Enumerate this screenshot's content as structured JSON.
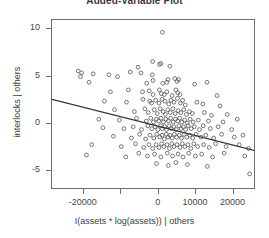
{
  "chart_data": {
    "type": "scatter",
    "title": "Added-Variable Plot",
    "xlabel": "I(assets * log(assets)) | others",
    "ylabel": "interlocks | others",
    "xlim": [
      -28500,
      26000
    ],
    "ylim": [
      -7.0,
      11.0
    ],
    "xticks": [
      -20000,
      -10000,
      0,
      10000,
      20000
    ],
    "xtick_labels": [
      "-20000",
      "",
      "0",
      "10000",
      "20000"
    ],
    "yticks": [
      10,
      5,
      0,
      -5
    ],
    "ytick_labels": [
      "10",
      "5",
      "0",
      "-5"
    ],
    "grid": false,
    "legend": null,
    "marker": "open-circle",
    "marker_color": "#555555",
    "regression_line": {
      "color": "#333333",
      "x_start": -28500,
      "y_start": 2.6,
      "x_end": 26000,
      "y_end": -2.85,
      "slope": -0.0001,
      "intercept": -0.25
    },
    "points": [
      [
        1000,
        9.7
      ],
      [
        -1600,
        6.6
      ],
      [
        -5500,
        6.0
      ],
      [
        200,
        6.3
      ],
      [
        600,
        6.4
      ],
      [
        3000,
        6.1
      ],
      [
        -21500,
        5.6
      ],
      [
        -20600,
        5.4
      ],
      [
        -20900,
        5.0
      ],
      [
        -17500,
        5.3
      ],
      [
        -13300,
        5.2
      ],
      [
        -11000,
        5.0
      ],
      [
        -7600,
        5.5
      ],
      [
        -4700,
        5.4
      ],
      [
        -1700,
        5.2
      ],
      [
        -1500,
        4.6
      ],
      [
        2500,
        4.7
      ],
      [
        -18600,
        4.4
      ],
      [
        -3200,
        4.3
      ],
      [
        1100,
        4.3
      ],
      [
        2200,
        4.4
      ],
      [
        4300,
        4.8
      ],
      [
        4900,
        4.5
      ],
      [
        5300,
        4.7
      ],
      [
        9600,
        4.2
      ],
      [
        12900,
        4.4
      ],
      [
        -12900,
        3.4
      ],
      [
        -8100,
        3.6
      ],
      [
        -4300,
        3.4
      ],
      [
        -2500,
        3.5
      ],
      [
        -1500,
        3.1
      ],
      [
        200,
        3.6
      ],
      [
        700,
        3.2
      ],
      [
        1500,
        3.1
      ],
      [
        2200,
        3.4
      ],
      [
        3600,
        3.0
      ],
      [
        4600,
        3.6
      ],
      [
        5100,
        3.3
      ],
      [
        5700,
        3.1
      ],
      [
        15600,
        3.0
      ],
      [
        -14500,
        2.4
      ],
      [
        -8600,
        2.3
      ],
      [
        -4200,
        2.6
      ],
      [
        -2400,
        2.4
      ],
      [
        -1900,
        2.2
      ],
      [
        -800,
        2.5
      ],
      [
        100,
        2.2
      ],
      [
        900,
        2.6
      ],
      [
        1700,
        2.4
      ],
      [
        2700,
        2.1
      ],
      [
        3300,
        2.5
      ],
      [
        4100,
        2.3
      ],
      [
        5000,
        2.7
      ],
      [
        5800,
        2.2
      ],
      [
        6400,
        2.5
      ],
      [
        7100,
        2.0
      ],
      [
        10200,
        2.3
      ],
      [
        11800,
        2.1
      ],
      [
        16400,
        1.9
      ],
      [
        -11800,
        1.5
      ],
      [
        -6500,
        1.3
      ],
      [
        -3700,
        1.6
      ],
      [
        -2800,
        1.2
      ],
      [
        -1200,
        1.5
      ],
      [
        -400,
        1.1
      ],
      [
        400,
        1.6
      ],
      [
        1200,
        1.3
      ],
      [
        1800,
        1.0
      ],
      [
        2400,
        1.5
      ],
      [
        3100,
        1.2
      ],
      [
        3800,
        1.6
      ],
      [
        4400,
        1.1
      ],
      [
        5200,
        1.4
      ],
      [
        5900,
        1.2
      ],
      [
        6700,
        1.5
      ],
      [
        7400,
        1.0
      ],
      [
        8200,
        1.3
      ],
      [
        9000,
        1.1
      ],
      [
        12200,
        1.2
      ],
      [
        14100,
        0.9
      ],
      [
        18300,
        1.0
      ],
      [
        -16000,
        0.5
      ],
      [
        -10500,
        0.4
      ],
      [
        -5900,
        0.6
      ],
      [
        -3300,
        0.3
      ],
      [
        -2100,
        0.6
      ],
      [
        -1400,
        0.2
      ],
      [
        -600,
        0.5
      ],
      [
        0,
        0.3
      ],
      [
        600,
        0.6
      ],
      [
        1300,
        0.2
      ],
      [
        1900,
        0.5
      ],
      [
        2600,
        0.3
      ],
      [
        3200,
        0.6
      ],
      [
        3900,
        0.2
      ],
      [
        4500,
        0.5
      ],
      [
        5100,
        0.3
      ],
      [
        5600,
        0.6
      ],
      [
        6200,
        0.2
      ],
      [
        6900,
        0.4
      ],
      [
        7600,
        0.1
      ],
      [
        8400,
        0.5
      ],
      [
        9200,
        0.2
      ],
      [
        10600,
        0.4
      ],
      [
        13300,
        0.3
      ],
      [
        17200,
        0.2
      ],
      [
        21000,
        0.5
      ],
      [
        -14900,
        -0.4
      ],
      [
        -9300,
        -0.5
      ],
      [
        -6800,
        -0.3
      ],
      [
        -4600,
        -0.6
      ],
      [
        -2900,
        -0.2
      ],
      [
        -1800,
        -0.5
      ],
      [
        -1000,
        -0.3
      ],
      [
        -200,
        -0.6
      ],
      [
        500,
        -0.2
      ],
      [
        1000,
        -0.5
      ],
      [
        1600,
        -0.3
      ],
      [
        2100,
        -0.6
      ],
      [
        2800,
        -0.2
      ],
      [
        3400,
        -0.5
      ],
      [
        4000,
        -0.3
      ],
      [
        4700,
        -0.6
      ],
      [
        5400,
        -0.2
      ],
      [
        6000,
        -0.5
      ],
      [
        6600,
        -0.3
      ],
      [
        7200,
        -0.6
      ],
      [
        7900,
        -0.2
      ],
      [
        8700,
        -0.5
      ],
      [
        9500,
        -0.3
      ],
      [
        10900,
        -0.6
      ],
      [
        11900,
        -0.2
      ],
      [
        13800,
        -0.5
      ],
      [
        15900,
        -0.3
      ],
      [
        19500,
        -0.6
      ],
      [
        -12100,
        -1.3
      ],
      [
        -7300,
        -1.5
      ],
      [
        -5100,
        -1.1
      ],
      [
        -3500,
        -1.6
      ],
      [
        -2300,
        -1.2
      ],
      [
        -1300,
        -1.5
      ],
      [
        -500,
        -1.1
      ],
      [
        300,
        -1.4
      ],
      [
        900,
        -1.2
      ],
      [
        1500,
        -1.6
      ],
      [
        2000,
        -1.1
      ],
      [
        2500,
        -1.4
      ],
      [
        3000,
        -1.2
      ],
      [
        3600,
        -1.5
      ],
      [
        4200,
        -1.1
      ],
      [
        4800,
        -1.4
      ],
      [
        5500,
        -1.2
      ],
      [
        6100,
        -1.5
      ],
      [
        6800,
        -1.1
      ],
      [
        7500,
        -1.4
      ],
      [
        8300,
        -1.2
      ],
      [
        9100,
        -1.5
      ],
      [
        10000,
        -1.1
      ],
      [
        11300,
        -1.4
      ],
      [
        12600,
        -1.2
      ],
      [
        14700,
        -1.5
      ],
      [
        16800,
        -1.1
      ],
      [
        20200,
        -1.4
      ],
      [
        22500,
        -1.2
      ],
      [
        -17900,
        -2.2
      ],
      [
        -10000,
        -2.4
      ],
      [
        -6200,
        -2.1
      ],
      [
        -4000,
        -2.5
      ],
      [
        -2600,
        -2.2
      ],
      [
        -1600,
        -2.6
      ],
      [
        -700,
        -2.2
      ],
      [
        100,
        -2.5
      ],
      [
        800,
        -2.1
      ],
      [
        1400,
        -2.4
      ],
      [
        2200,
        -2.2
      ],
      [
        2900,
        -2.6
      ],
      [
        3500,
        -2.1
      ],
      [
        4100,
        -2.4
      ],
      [
        4900,
        -2.2
      ],
      [
        5700,
        -2.5
      ],
      [
        6300,
        -2.1
      ],
      [
        7000,
        -2.4
      ],
      [
        7800,
        -2.2
      ],
      [
        8600,
        -2.6
      ],
      [
        9400,
        -2.1
      ],
      [
        10400,
        -2.4
      ],
      [
        12000,
        -2.2
      ],
      [
        13500,
        -2.5
      ],
      [
        15200,
        -2.1
      ],
      [
        18000,
        -2.4
      ],
      [
        21500,
        -2.2
      ],
      [
        24000,
        -2.6
      ],
      [
        -19300,
        -3.3
      ],
      [
        -8800,
        -3.5
      ],
      [
        -5300,
        -3.1
      ],
      [
        -3000,
        -3.4
      ],
      [
        -1100,
        -3.2
      ],
      [
        600,
        -3.5
      ],
      [
        2300,
        -3.1
      ],
      [
        3700,
        -3.4
      ],
      [
        5200,
        -3.2
      ],
      [
        6500,
        -3.5
      ],
      [
        8000,
        -3.1
      ],
      [
        9800,
        -3.4
      ],
      [
        11500,
        -3.2
      ],
      [
        14400,
        -3.5
      ],
      [
        17500,
        -3.1
      ],
      [
        23000,
        -3.4
      ],
      [
        -600,
        -4.2
      ],
      [
        2600,
        -4.4
      ],
      [
        4600,
        -4.1
      ],
      [
        7700,
        -4.3
      ],
      [
        13000,
        -4.5
      ],
      [
        24300,
        -5.3
      ]
    ]
  }
}
